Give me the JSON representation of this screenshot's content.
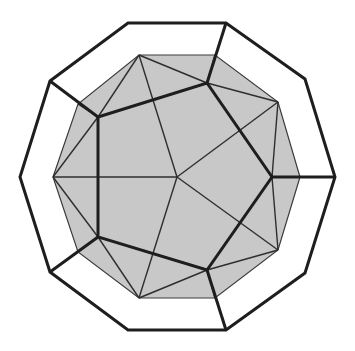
{
  "figure": {
    "title": "Dodecahedron-like polyhedron net: pentagon face inside shaded decagon with outer decagon frame",
    "colors": {
      "background": "#ffffff",
      "shaded_region": "#c8c8c8",
      "edge": "#1e1e1e",
      "thin_edge": "#2e2e2e"
    },
    "outer_decagon": [
      [
        128,
        23
      ],
      [
        226,
        23
      ],
      [
        305,
        79
      ],
      [
        335,
        177
      ],
      [
        305,
        273
      ],
      [
        226,
        330
      ],
      [
        128,
        330
      ],
      [
        50,
        272
      ],
      [
        20,
        177
      ],
      [
        50,
        81
      ]
    ],
    "inner_decagon": [
      [
        139,
        55
      ],
      [
        215,
        55
      ],
      [
        278,
        102
      ],
      [
        300,
        177
      ],
      [
        278,
        250
      ],
      [
        215,
        298
      ],
      [
        139,
        298
      ],
      [
        78,
        252
      ],
      [
        53,
        177
      ],
      [
        78,
        104
      ]
    ],
    "pentagon": [
      [
        98,
        117
      ],
      [
        207,
        83
      ],
      [
        272,
        177
      ],
      [
        207,
        270
      ],
      [
        98,
        237
      ]
    ],
    "center": [
      177,
      177
    ],
    "connectors": [
      [
        [
          50,
          81
        ],
        [
          98,
          117
        ]
      ],
      [
        [
          226,
          23
        ],
        [
          207,
          83
        ]
      ],
      [
        [
          335,
          177
        ],
        [
          272,
          177
        ]
      ],
      [
        [
          226,
          330
        ],
        [
          207,
          270
        ]
      ],
      [
        [
          50,
          272
        ],
        [
          98,
          237
        ]
      ]
    ],
    "thin_lines": [
      [
        [
          139,
          55
        ],
        [
          98,
          117
        ]
      ],
      [
        [
          139,
          55
        ],
        [
          207,
          83
        ]
      ],
      [
        [
          139,
          55
        ],
        [
          177,
          177
        ]
      ],
      [
        [
          215,
          55
        ],
        [
          207,
          83
        ]
      ],
      [
        [
          207,
          83
        ],
        [
          278,
          102
        ]
      ],
      [
        [
          278,
          102
        ],
        [
          272,
          177
        ]
      ],
      [
        [
          278,
          102
        ],
        [
          177,
          177
        ]
      ],
      [
        [
          272,
          177
        ],
        [
          300,
          177
        ]
      ],
      [
        [
          272,
          177
        ],
        [
          278,
          250
        ]
      ],
      [
        [
          278,
          250
        ],
        [
          207,
          270
        ]
      ],
      [
        [
          278,
          250
        ],
        [
          177,
          177
        ]
      ],
      [
        [
          207,
          270
        ],
        [
          215,
          298
        ]
      ],
      [
        [
          207,
          270
        ],
        [
          139,
          298
        ]
      ],
      [
        [
          139,
          298
        ],
        [
          98,
          237
        ]
      ],
      [
        [
          139,
          298
        ],
        [
          177,
          177
        ]
      ],
      [
        [
          98,
          237
        ],
        [
          78,
          252
        ]
      ],
      [
        [
          98,
          237
        ],
        [
          53,
          177
        ]
      ],
      [
        [
          53,
          177
        ],
        [
          98,
          117
        ]
      ],
      [
        [
          53,
          177
        ],
        [
          177,
          177
        ]
      ],
      [
        [
          78,
          104
        ],
        [
          98,
          117
        ]
      ]
    ]
  }
}
